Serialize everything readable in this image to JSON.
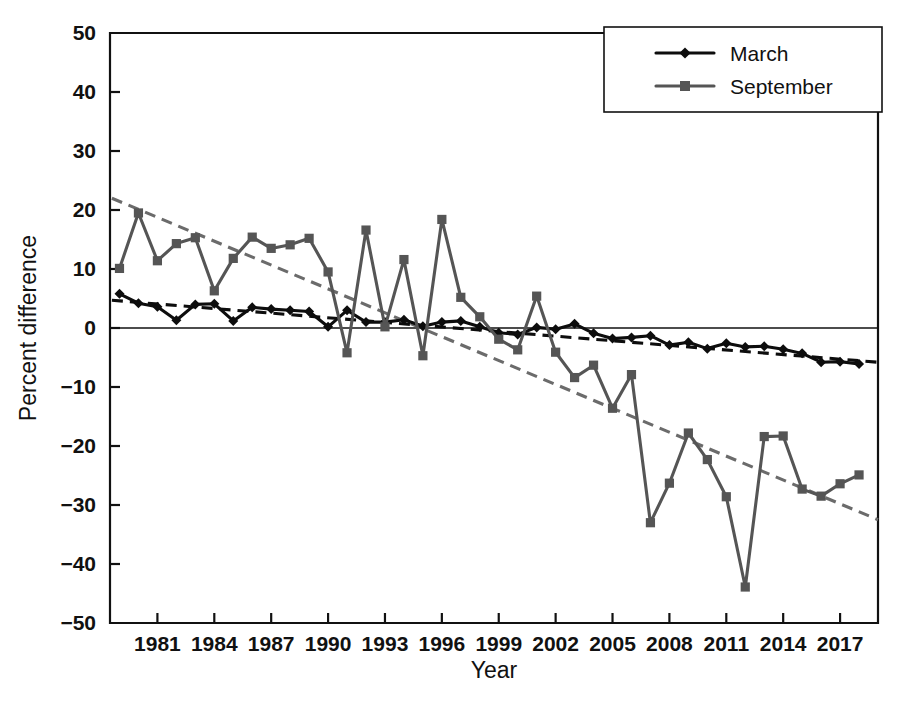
{
  "chart_data": {
    "type": "line",
    "title": "",
    "xlabel": "Year",
    "ylabel": "Percent difference",
    "xlim": [
      1978.5,
      2019
    ],
    "ylim": [
      -50,
      50
    ],
    "grid": false,
    "legend_position": "top-right",
    "xticks": [
      1981,
      1984,
      1987,
      1990,
      1993,
      1996,
      1999,
      2002,
      2005,
      2008,
      2011,
      2014,
      2017
    ],
    "yticks": [
      -50,
      -40,
      -30,
      -20,
      -10,
      0,
      10,
      20,
      30,
      40,
      50
    ],
    "ytick_labels": [
      "−50",
      "−40",
      "−30",
      "−20",
      "−10",
      "0",
      "10",
      "20",
      "30",
      "40",
      "50"
    ],
    "x": [
      1979,
      1980,
      1981,
      1982,
      1983,
      1984,
      1985,
      1986,
      1987,
      1988,
      1989,
      1990,
      1991,
      1992,
      1993,
      1994,
      1995,
      1996,
      1997,
      1998,
      1999,
      2000,
      2001,
      2002,
      2003,
      2004,
      2005,
      2006,
      2007,
      2008,
      2009,
      2010,
      2011,
      2012,
      2013,
      2014,
      2015,
      2016,
      2017,
      2018
    ],
    "series": [
      {
        "name": "March",
        "color": "#0d0d0d",
        "marker": "diamond",
        "values": [
          5.8,
          4.2,
          3.6,
          1.3,
          4.0,
          4.1,
          1.2,
          3.5,
          3.2,
          3.0,
          2.8,
          0.2,
          3.0,
          1.0,
          1.0,
          1.4,
          0.3,
          1.0,
          1.2,
          0.2,
          -0.8,
          -1.1,
          0.1,
          -0.2,
          0.7,
          -0.9,
          -1.8,
          -1.6,
          -1.3,
          -2.9,
          -2.4,
          -3.5,
          -2.6,
          -3.2,
          -3.1,
          -3.6,
          -4.3,
          -5.8,
          -5.7,
          -6.1
        ]
      },
      {
        "name": "September",
        "color": "#555555",
        "marker": "square",
        "values": [
          10.1,
          19.5,
          11.4,
          14.3,
          15.3,
          6.3,
          11.8,
          15.4,
          13.5,
          14.1,
          15.2,
          9.5,
          -4.2,
          16.6,
          0.2,
          11.6,
          -4.7,
          18.4,
          5.2,
          1.9,
          -1.9,
          -3.7,
          5.4,
          -4.1,
          -8.4,
          -6.3,
          -13.6,
          -7.9,
          -33.0,
          -26.3,
          -17.8,
          -22.3,
          -28.6,
          -43.9,
          -18.4,
          -18.3,
          -27.3,
          -28.5,
          -26.4,
          -24.9
        ]
      }
    ],
    "trendlines": [
      {
        "name": "March trend",
        "color": "#0d0d0d",
        "style": "dashed",
        "x": [
          1978.6,
          2019.0
        ],
        "y": [
          4.7,
          -5.8
        ]
      },
      {
        "name": "September trend",
        "color": "#6b6b6b",
        "style": "dashed",
        "x": [
          1978.6,
          2019.0
        ],
        "y": [
          22.0,
          -32.5
        ]
      }
    ],
    "legend": [
      {
        "label": "March",
        "color": "#0d0d0d",
        "marker": "diamond"
      },
      {
        "label": "September",
        "color": "#555555",
        "marker": "square"
      }
    ]
  }
}
